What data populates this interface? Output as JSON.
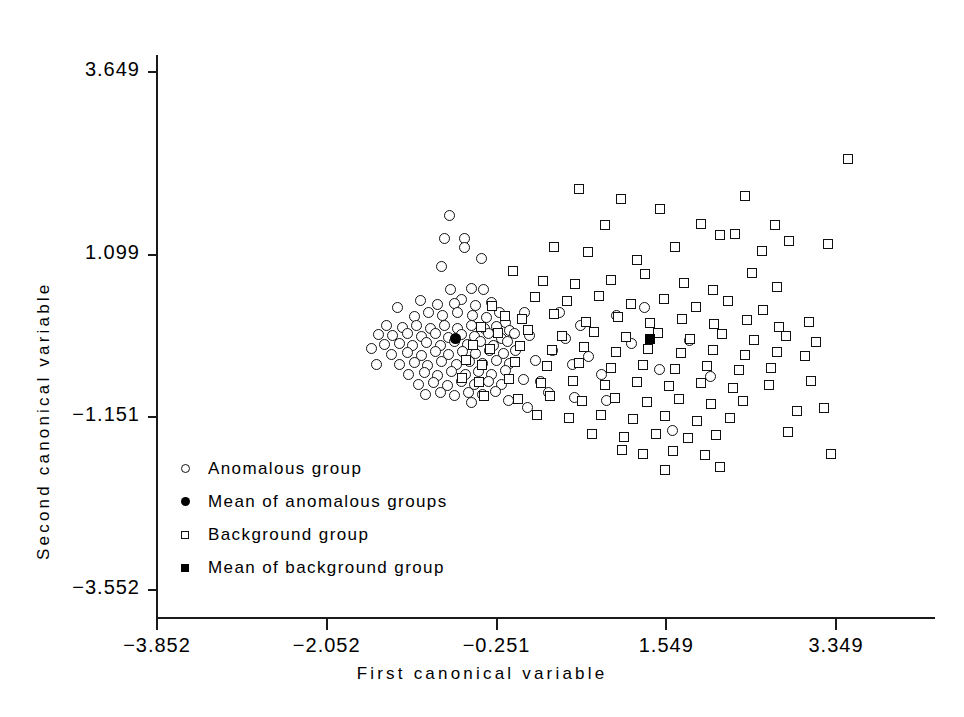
{
  "chart_data": {
    "type": "scatter",
    "title": "",
    "xlabel": "First canonical variable",
    "ylabel": "Second canonical variable",
    "xlim": [
      -3.852,
      4.0
    ],
    "ylim": [
      -3.552,
      4.0
    ],
    "grid": false,
    "legend_position": "inside-lower-left",
    "xticks": [
      -3.852,
      -2.052,
      -0.251,
      1.549,
      3.349
    ],
    "xtick_labels": [
      "-3.852",
      "-2.052",
      "-0.251",
      "1.549",
      "3.349"
    ],
    "yticks": [
      -3.552,
      -1.151,
      1.099,
      3.649
    ],
    "ytick_labels": [
      "-3.552",
      "-1.151",
      "1.099",
      "3.649"
    ],
    "series": [
      {
        "name": "Anomalous group",
        "marker": "open-circle",
        "points": [
          [
            -0.75,
            1.66
          ],
          [
            -0.8,
            1.34
          ],
          [
            -0.59,
            1.34
          ],
          [
            -0.59,
            1.21
          ],
          [
            -0.83,
            0.95
          ],
          [
            -0.41,
            1.05
          ],
          [
            -0.74,
            0.62
          ],
          [
            -0.52,
            0.64
          ],
          [
            -0.39,
            0.63
          ],
          [
            -0.62,
            0.49
          ],
          [
            -1.06,
            0.47
          ],
          [
            -0.88,
            0.42
          ],
          [
            -0.7,
            0.43
          ],
          [
            -0.47,
            0.4
          ],
          [
            -0.3,
            0.44
          ],
          [
            -1.3,
            0.38
          ],
          [
            -1.12,
            0.25
          ],
          [
            -0.97,
            0.3
          ],
          [
            -0.82,
            0.27
          ],
          [
            -0.66,
            0.3
          ],
          [
            -0.51,
            0.26
          ],
          [
            -0.36,
            0.24
          ],
          [
            -0.22,
            0.3
          ],
          [
            -0.16,
            0.16
          ],
          [
            -1.42,
            0.12
          ],
          [
            -1.25,
            0.1
          ],
          [
            -1.1,
            0.12
          ],
          [
            -0.95,
            0.09
          ],
          [
            -0.8,
            0.13
          ],
          [
            -0.66,
            0.08
          ],
          [
            -0.52,
            0.12
          ],
          [
            -0.38,
            0.08
          ],
          [
            -0.25,
            0.11
          ],
          [
            -0.11,
            0.05
          ],
          [
            -1.5,
            0.0
          ],
          [
            -1.35,
            -0.02
          ],
          [
            -1.2,
            0.02
          ],
          [
            -1.05,
            -0.03
          ],
          [
            -0.9,
            0.01
          ],
          [
            -0.76,
            -0.04
          ],
          [
            -0.62,
            0.0
          ],
          [
            -0.48,
            -0.03
          ],
          [
            -0.34,
            0.01
          ],
          [
            -0.2,
            -0.05
          ],
          [
            -0.06,
            0.02
          ],
          [
            -1.44,
            -0.14
          ],
          [
            -1.28,
            -0.12
          ],
          [
            -1.14,
            -0.16
          ],
          [
            -0.99,
            -0.11
          ],
          [
            -0.85,
            -0.15
          ],
          [
            -0.7,
            -0.1
          ],
          [
            -0.56,
            -0.14
          ],
          [
            -0.42,
            -0.1
          ],
          [
            -0.28,
            -0.15
          ],
          [
            -0.14,
            -0.1
          ],
          [
            -1.36,
            -0.28
          ],
          [
            -1.2,
            -0.25
          ],
          [
            -1.05,
            -0.29
          ],
          [
            -0.9,
            -0.24
          ],
          [
            -0.76,
            -0.28
          ],
          [
            -0.61,
            -0.23
          ],
          [
            -0.47,
            -0.27
          ],
          [
            -0.33,
            -0.22
          ],
          [
            -0.18,
            -0.27
          ],
          [
            -0.05,
            -0.22
          ],
          [
            -1.28,
            -0.42
          ],
          [
            -1.12,
            -0.39
          ],
          [
            -0.98,
            -0.43
          ],
          [
            -0.83,
            -0.38
          ],
          [
            -0.68,
            -0.42
          ],
          [
            -0.54,
            -0.37
          ],
          [
            -0.4,
            -0.41
          ],
          [
            -0.25,
            -0.36
          ],
          [
            -0.11,
            -0.4
          ],
          [
            -1.18,
            -0.56
          ],
          [
            -1.02,
            -0.53
          ],
          [
            -0.88,
            -0.57
          ],
          [
            -0.73,
            -0.52
          ],
          [
            -0.58,
            -0.56
          ],
          [
            -0.44,
            -0.51
          ],
          [
            -0.3,
            -0.55
          ],
          [
            -0.16,
            -0.5
          ],
          [
            -1.08,
            -0.7
          ],
          [
            -0.92,
            -0.67
          ],
          [
            -0.77,
            -0.71
          ],
          [
            -0.62,
            -0.66
          ],
          [
            -0.48,
            -0.7
          ],
          [
            -0.34,
            -0.65
          ],
          [
            -0.2,
            -0.69
          ],
          [
            -1.0,
            -0.84
          ],
          [
            -0.85,
            -0.8
          ],
          [
            -0.7,
            -0.85
          ],
          [
            -0.55,
            -0.8
          ],
          [
            -0.4,
            -0.84
          ],
          [
            -0.26,
            -0.79
          ],
          [
            -1.58,
            -0.2
          ],
          [
            -1.52,
            -0.42
          ],
          [
            0.05,
            0.3
          ],
          [
            0.1,
            -0.02
          ],
          [
            0.16,
            -0.36
          ],
          [
            0.03,
            -0.62
          ],
          [
            0.22,
            -0.66
          ],
          [
            0.34,
            -0.22
          ],
          [
            0.42,
            0.3
          ],
          [
            0.48,
            -0.05
          ],
          [
            0.55,
            -0.42
          ],
          [
            0.64,
            0.12
          ],
          [
            0.72,
            -0.3
          ],
          [
            0.86,
            -0.56
          ],
          [
            0.3,
            -0.8
          ],
          [
            0.58,
            -0.88
          ],
          [
            1.02,
            0.26
          ],
          [
            1.18,
            -0.12
          ],
          [
            1.32,
            0.38
          ],
          [
            1.48,
            -0.48
          ],
          [
            1.62,
            -1.34
          ],
          [
            1.8,
            -0.08
          ],
          [
            2.02,
            -0.58
          ],
          [
            0.92,
            -0.92
          ],
          [
            -0.12,
            -0.92
          ],
          [
            -0.52,
            -0.94
          ],
          [
            0.08,
            -1.02
          ]
        ]
      },
      {
        "name": "Mean of anomalous groups",
        "marker": "filled-circle",
        "points": [
          [
            -0.69,
            -0.06
          ]
        ]
      },
      {
        "name": "Background group",
        "marker": "open-square",
        "points": [
          [
            0.62,
            2.02
          ],
          [
            1.07,
            1.88
          ],
          [
            0.9,
            1.52
          ],
          [
            1.48,
            1.74
          ],
          [
            1.92,
            1.54
          ],
          [
            2.38,
            1.92
          ],
          [
            2.7,
            1.52
          ],
          [
            3.48,
            2.44
          ],
          [
            0.36,
            1.22
          ],
          [
            0.72,
            1.14
          ],
          [
            1.24,
            1.04
          ],
          [
            1.64,
            1.22
          ],
          [
            2.12,
            1.38
          ],
          [
            2.28,
            1.4
          ],
          [
            2.56,
            1.16
          ],
          [
            2.85,
            1.3
          ],
          [
            3.26,
            1.26
          ],
          [
            -0.08,
            0.88
          ],
          [
            0.24,
            0.74
          ],
          [
            0.58,
            0.7
          ],
          [
            0.96,
            0.76
          ],
          [
            1.32,
            0.84
          ],
          [
            1.74,
            0.72
          ],
          [
            2.04,
            0.62
          ],
          [
            2.46,
            0.86
          ],
          [
            2.72,
            0.66
          ],
          [
            0.16,
            0.52
          ],
          [
            0.5,
            0.46
          ],
          [
            0.84,
            0.54
          ],
          [
            1.18,
            0.42
          ],
          [
            1.52,
            0.5
          ],
          [
            1.86,
            0.38
          ],
          [
            2.2,
            0.46
          ],
          [
            2.58,
            0.34
          ],
          [
            -0.3,
            0.4
          ],
          [
            -0.16,
            0.26
          ],
          [
            0.02,
            0.22
          ],
          [
            0.36,
            0.28
          ],
          [
            0.7,
            0.18
          ],
          [
            1.04,
            0.24
          ],
          [
            1.38,
            0.16
          ],
          [
            1.72,
            0.22
          ],
          [
            2.06,
            0.14
          ],
          [
            2.4,
            0.2
          ],
          [
            2.74,
            0.1
          ],
          [
            3.06,
            0.18
          ],
          [
            -0.42,
            0.1
          ],
          [
            -0.24,
            0.02
          ],
          [
            0.08,
            0.06
          ],
          [
            0.44,
            -0.02
          ],
          [
            0.78,
            0.04
          ],
          [
            1.12,
            -0.04
          ],
          [
            1.46,
            0.02
          ],
          [
            1.8,
            -0.06
          ],
          [
            2.14,
            0.0
          ],
          [
            2.48,
            -0.08
          ],
          [
            2.82,
            -0.02
          ],
          [
            3.14,
            -0.1
          ],
          [
            -0.5,
            -0.14
          ],
          [
            -0.32,
            -0.2
          ],
          [
            0.0,
            -0.16
          ],
          [
            0.34,
            -0.22
          ],
          [
            0.68,
            -0.18
          ],
          [
            1.02,
            -0.24
          ],
          [
            1.36,
            -0.2
          ],
          [
            1.7,
            -0.26
          ],
          [
            2.04,
            -0.22
          ],
          [
            2.38,
            -0.28
          ],
          [
            2.72,
            -0.24
          ],
          [
            3.02,
            -0.3
          ],
          [
            -0.58,
            -0.36
          ],
          [
            -0.4,
            -0.42
          ],
          [
            -0.06,
            -0.38
          ],
          [
            0.28,
            -0.44
          ],
          [
            0.62,
            -0.4
          ],
          [
            0.96,
            -0.46
          ],
          [
            1.3,
            -0.42
          ],
          [
            1.64,
            -0.48
          ],
          [
            1.98,
            -0.44
          ],
          [
            2.32,
            -0.5
          ],
          [
            2.66,
            -0.46
          ],
          [
            -0.62,
            -0.6
          ],
          [
            -0.44,
            -0.66
          ],
          [
            -0.12,
            -0.62
          ],
          [
            0.22,
            -0.68
          ],
          [
            0.56,
            -0.64
          ],
          [
            0.9,
            -0.7
          ],
          [
            1.24,
            -0.66
          ],
          [
            1.58,
            -0.72
          ],
          [
            1.92,
            -0.68
          ],
          [
            2.26,
            -0.74
          ],
          [
            2.64,
            -0.7
          ],
          [
            3.08,
            -0.64
          ],
          [
            -0.38,
            -0.86
          ],
          [
            -0.02,
            -0.9
          ],
          [
            0.32,
            -0.86
          ],
          [
            0.66,
            -0.92
          ],
          [
            1.0,
            -0.88
          ],
          [
            1.34,
            -0.94
          ],
          [
            1.68,
            -0.9
          ],
          [
            2.02,
            -0.96
          ],
          [
            2.36,
            -0.92
          ],
          [
            0.18,
            -1.12
          ],
          [
            0.52,
            -1.16
          ],
          [
            0.86,
            -1.12
          ],
          [
            1.2,
            -1.18
          ],
          [
            1.54,
            -1.14
          ],
          [
            1.88,
            -1.2
          ],
          [
            2.22,
            -1.16
          ],
          [
            0.76,
            -1.38
          ],
          [
            1.1,
            -1.42
          ],
          [
            1.44,
            -1.38
          ],
          [
            1.78,
            -1.44
          ],
          [
            2.08,
            -1.4
          ],
          [
            1.3,
            -1.66
          ],
          [
            1.62,
            -1.62
          ],
          [
            1.96,
            -1.68
          ],
          [
            1.54,
            -1.88
          ],
          [
            2.12,
            -1.84
          ],
          [
            1.08,
            -1.6
          ],
          [
            2.84,
            -1.36
          ],
          [
            2.94,
            -1.06
          ],
          [
            3.22,
            -1.02
          ],
          [
            3.3,
            -1.66
          ]
        ]
      },
      {
        "name": "Mean of background group",
        "marker": "filled-square",
        "points": [
          [
            1.38,
            -0.06
          ]
        ]
      }
    ]
  },
  "axes": {
    "x": {
      "title": "First canonical variable",
      "ticks": [
        {
          "value": -3.852,
          "label": "-3.852"
        },
        {
          "value": -2.052,
          "label": "-2.052"
        },
        {
          "value": -0.251,
          "label": "-0.251"
        },
        {
          "value": 1.549,
          "label": "1.549"
        },
        {
          "value": 3.349,
          "label": "3.349"
        }
      ]
    },
    "y": {
      "title": "Second canonical variable",
      "ticks": [
        {
          "value": 3.649,
          "label": "3.649"
        },
        {
          "value": 1.099,
          "label": "1.099"
        },
        {
          "value": -1.151,
          "label": "-1.151"
        },
        {
          "value": -3.552,
          "label": "-3.552"
        }
      ]
    }
  },
  "legend": {
    "items": [
      {
        "marker": "open-circle",
        "label": "Anomalous group"
      },
      {
        "marker": "filled-circle",
        "label": "Mean of anomalous groups"
      },
      {
        "marker": "open-square",
        "label": "Background group"
      },
      {
        "marker": "filled-square",
        "label": "Mean of background group"
      }
    ]
  },
  "colors": {
    "ink": "#111111",
    "background": "#ffffff"
  }
}
